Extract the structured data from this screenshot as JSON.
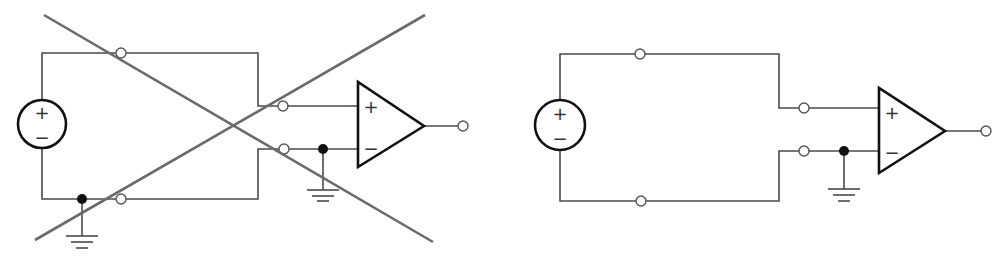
{
  "figure": {
    "colors": {
      "wire": "#4a4a4a",
      "symbol_outline": "#111111",
      "cross_out": "#6a6a6a",
      "background": "#ffffff"
    },
    "panels": [
      {
        "id": "incorrect",
        "status": "crossed-out",
        "source": {
          "plus_label": "+",
          "minus_label": "−"
        },
        "opamp": {
          "plus_label": "+",
          "minus_label": "−"
        },
        "ground_connections": [
          "source negative node",
          "op-amp inverting input"
        ]
      },
      {
        "id": "correct",
        "status": "valid",
        "source": {
          "plus_label": "+",
          "minus_label": "−"
        },
        "opamp": {
          "plus_label": "+",
          "minus_label": "−"
        },
        "ground_connections": [
          "op-amp inverting input"
        ]
      }
    ]
  }
}
